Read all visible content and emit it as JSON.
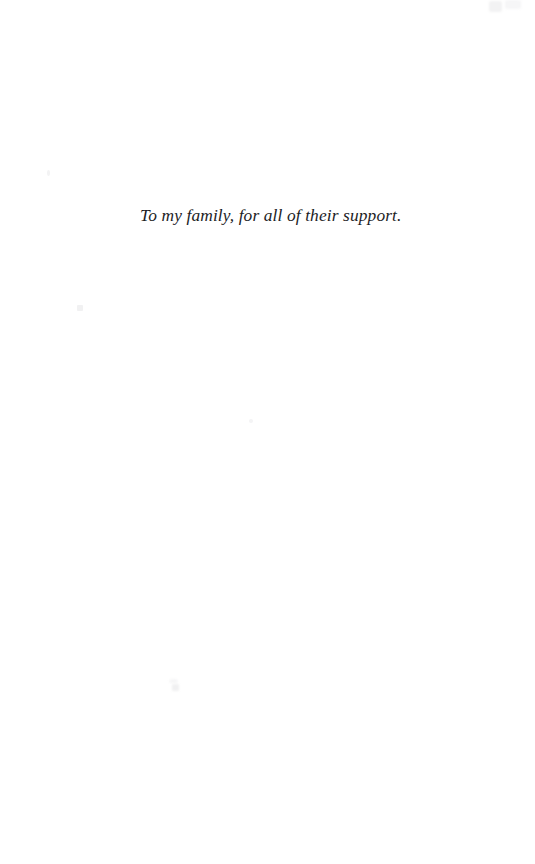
{
  "page": {
    "kind": "book-dedication-page",
    "background_color": "#ffffff",
    "text_color": "#1d1d1f"
  },
  "dedication": {
    "text": "To my family, for all of their support."
  },
  "artifacts": {
    "speck_color_light": "#f5f5f6",
    "speck_color_dark": "#f0f0f1"
  }
}
